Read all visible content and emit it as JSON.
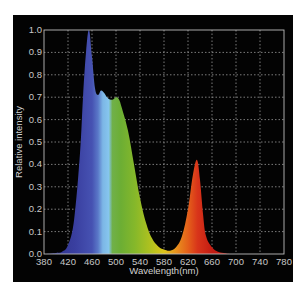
{
  "chart_data": {
    "type": "area",
    "title": "",
    "xlabel": "Wavelength(nm)",
    "ylabel": "Relative intensity",
    "xlim": [
      380,
      780
    ],
    "ylim": [
      0.0,
      1.0
    ],
    "grid": true,
    "legend": null,
    "x_ticks": [
      "380",
      "420",
      "460",
      "500",
      "540",
      "580",
      "620",
      "660",
      "700",
      "740",
      "780"
    ],
    "y_ticks": [
      "0.0",
      "0.1",
      "0.2",
      "0.3",
      "0.4",
      "0.5",
      "0.6",
      "0.7",
      "0.8",
      "0.9",
      "1.0"
    ],
    "x": [
      380,
      400,
      410,
      420,
      430,
      440,
      445,
      450,
      455,
      460,
      465,
      470,
      475,
      480,
      485,
      490,
      495,
      500,
      505,
      510,
      520,
      530,
      540,
      550,
      560,
      570,
      580,
      590,
      600,
      610,
      620,
      628,
      635,
      640,
      645,
      650,
      660,
      670,
      680,
      700,
      780
    ],
    "values": [
      0.0,
      0.005,
      0.01,
      0.04,
      0.15,
      0.45,
      0.7,
      0.9,
      1.0,
      0.88,
      0.74,
      0.71,
      0.73,
      0.72,
      0.7,
      0.69,
      0.69,
      0.7,
      0.69,
      0.65,
      0.55,
      0.4,
      0.25,
      0.14,
      0.07,
      0.035,
      0.02,
      0.015,
      0.03,
      0.08,
      0.2,
      0.35,
      0.42,
      0.33,
      0.18,
      0.08,
      0.03,
      0.01,
      0.005,
      0.0,
      0.0
    ],
    "peaks": [
      {
        "wavelength_nm": 455,
        "value": 1.0,
        "color": "blue"
      },
      {
        "wavelength_nm": 475,
        "value": 0.73,
        "color": "cyan"
      },
      {
        "wavelength_nm": 500,
        "value": 0.7,
        "color": "green"
      },
      {
        "wavelength_nm": 635,
        "value": 0.42,
        "color": "red"
      }
    ],
    "fill_gradient": "visible spectrum (violet-blue → cyan → green → yellow → orange → red)"
  },
  "colors": {
    "background": "#030303",
    "grid": "#9a9a9a",
    "axis": "#bdbdbd",
    "text": "#c8c8c8",
    "spectrum_stops": [
      "#2b2f86",
      "#3a3fa0",
      "#4b5bbf",
      "#6fa8de",
      "#7fc1ea",
      "#6fb23a",
      "#8cbc2e",
      "#a8c21e",
      "#d8c81a",
      "#e8a020",
      "#e4601a",
      "#d8301a",
      "#c01810"
    ]
  }
}
